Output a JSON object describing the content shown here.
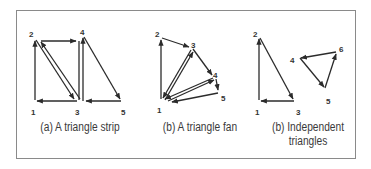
{
  "figure": {
    "panels": [
      {
        "id": "strip",
        "caption": "(a) A triangle strip",
        "caption_lines": [
          "(a) A triangle strip"
        ],
        "vertices": [
          {
            "label": "1",
            "x": 35,
            "y": 101
          },
          {
            "label": "2",
            "x": 35,
            "y": 39
          },
          {
            "label": "3",
            "x": 78,
            "y": 101
          },
          {
            "label": "4",
            "x": 83,
            "y": 36
          },
          {
            "label": "5",
            "x": 122,
            "y": 101
          }
        ]
      },
      {
        "id": "fan",
        "caption": "(b) A triangle fan",
        "caption_lines": [
          "(b) A triangle fan"
        ],
        "vertices": [
          {
            "label": "1",
            "x": 161,
            "y": 100
          },
          {
            "label": "2",
            "x": 161,
            "y": 38
          },
          {
            "label": "3",
            "x": 192,
            "y": 48
          },
          {
            "label": "4",
            "x": 215,
            "y": 77
          },
          {
            "label": "5",
            "x": 219,
            "y": 92
          }
        ]
      },
      {
        "id": "independent",
        "caption": "(b) Independent triangles",
        "caption_lines": [
          "(b) Independent",
          "triangles"
        ],
        "vertices": [
          {
            "label": "1",
            "x": 259,
            "y": 101
          },
          {
            "label": "2",
            "x": 259,
            "y": 37
          },
          {
            "label": "3",
            "x": 295,
            "y": 101
          },
          {
            "label": "4",
            "x": 299,
            "y": 57
          },
          {
            "label": "5",
            "x": 325,
            "y": 89
          },
          {
            "label": "6",
            "x": 337,
            "y": 52
          }
        ]
      }
    ],
    "colors": {
      "line": "#2b2b2b",
      "frame": "#8a8a8a",
      "text": "#3a3a3a"
    }
  }
}
